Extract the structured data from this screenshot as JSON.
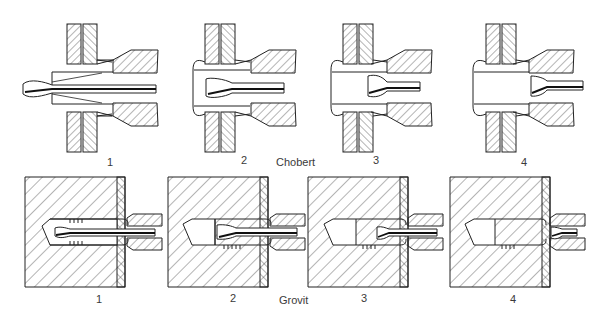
{
  "figure": {
    "rows": [
      {
        "name": "Chobert",
        "title": "Chobert",
        "steps": [
          {
            "label": "1"
          },
          {
            "label": "2"
          },
          {
            "label": "3"
          },
          {
            "label": "4"
          }
        ]
      },
      {
        "name": "Grovit",
        "title": "Grovit",
        "steps": [
          {
            "label": "1"
          },
          {
            "label": "2"
          },
          {
            "label": "3"
          },
          {
            "label": "4"
          }
        ]
      }
    ],
    "colors": {
      "line": "#222222",
      "hatch": "#444444",
      "mandrel": "#1a1a1a",
      "background": "#ffffff"
    }
  }
}
